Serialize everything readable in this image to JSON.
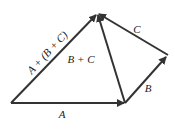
{
  "diagram": {
    "color": "#333333",
    "vectors": [
      {
        "id": "A",
        "label": "A",
        "from": [
          11,
          103
        ],
        "to": [
          124,
          103
        ],
        "label_pos": [
          62,
          118
        ],
        "rotate": 0
      },
      {
        "id": "B",
        "label": "B",
        "from": [
          125,
          103
        ],
        "to": [
          166,
          57
        ],
        "label_pos": [
          148,
          92
        ],
        "rotate": 0
      },
      {
        "id": "C",
        "label": "C",
        "from": [
          168,
          55
        ],
        "to": [
          99,
          14
        ],
        "label_pos": [
          137,
          33
        ],
        "rotate": 0
      },
      {
        "id": "BC",
        "label": "B + C",
        "from": [
          125,
          103
        ],
        "to": [
          98,
          15
        ],
        "label_pos": [
          81,
          63
        ],
        "rotate": 0
      },
      {
        "id": "ABC",
        "label": "A + (B + C)",
        "from": [
          11,
          103
        ],
        "to": [
          96,
          15
        ],
        "label_pos": [
          50,
          55
        ],
        "rotate": -47
      }
    ]
  }
}
